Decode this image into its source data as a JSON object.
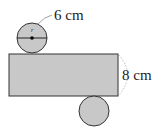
{
  "diagram": {
    "colors": {
      "fill": "#c8c8c8",
      "stroke": "#333333",
      "dashed": "#aaaaaa"
    },
    "top_circle": {
      "cx": 32,
      "cy": 38,
      "r": 15
    },
    "rectangle": {
      "x": 9,
      "y": 54,
      "width": 109,
      "height": 42
    },
    "bottom_circle": {
      "cx": 94,
      "cy": 111,
      "r": 15
    },
    "labels": {
      "diameter": "6 cm",
      "height": "8 cm",
      "radius_symbol": "r"
    }
  }
}
